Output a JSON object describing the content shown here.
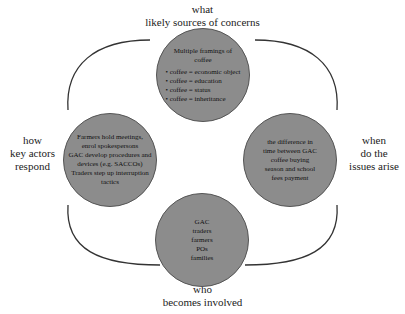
{
  "diagram": {
    "labels": {
      "top": [
        "what",
        "likely sources of concerns"
      ],
      "left": [
        "how",
        "key actors",
        "respond"
      ],
      "right": [
        "when",
        "do the",
        "issues arise"
      ],
      "bottom": [
        "who",
        "becomes involved"
      ]
    },
    "circles": {
      "top": {
        "title": "Multiple framings of coffee",
        "items": [
          "coffee = economic object",
          "coffee = education",
          "coffee = status",
          "coffee = inheritance"
        ]
      },
      "left": {
        "lines": [
          "Farmers hold meetings,",
          "enrol spokespersons",
          "GAC develop procedures and",
          "devices (e.g. SACCOs)",
          "Traders step up interruption",
          "tactics"
        ]
      },
      "right": {
        "lines": [
          "the difference in",
          "time between GAC",
          "coffee buying",
          "season and school",
          "fees payment"
        ]
      },
      "bottom": {
        "lines": [
          "GAC",
          "traders",
          "farmers",
          "POs",
          "families"
        ]
      }
    },
    "colors": {
      "circle_fill": "#8c8c8c",
      "arc_stroke": "#333333"
    }
  }
}
